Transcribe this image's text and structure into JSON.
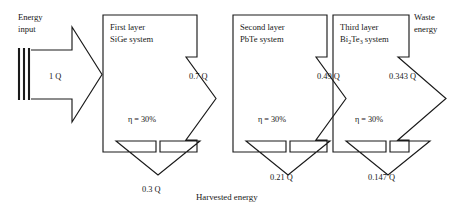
{
  "diagram": {
    "title_caption": "Harvested energy",
    "source": {
      "label_line1": "Energy",
      "label_line2": "input",
      "flow_value": "1 Q",
      "bar_count": 3
    },
    "waste": {
      "label_line1": "Waste",
      "label_line2": "energy",
      "flow_value": "0.343 Q"
    },
    "stages": [
      {
        "name_line1": "First layer",
        "name_line2_pre": "SiGe",
        "name_line2_sub": "",
        "name_line2_post": " system",
        "efficiency": "η = 30%",
        "output_right": "0.7 Q",
        "output_down": "0.3 Q"
      },
      {
        "name_line1": "Second layer",
        "name_line2_pre": "PbTe",
        "name_line2_sub": "",
        "name_line2_post": " system",
        "efficiency": "η = 30%",
        "output_right": "0.49 Q",
        "output_down": "0.21 Q"
      },
      {
        "name_line1": "Third layer",
        "name_line2_pre": "Bi",
        "name_line2_sub1": "2",
        "name_line2_mid": "Te",
        "name_line2_sub2": "3",
        "name_line2_post": " system",
        "efficiency": "η = 30%",
        "output_right": "0.343 Q",
        "output_down": "0.147 Q"
      }
    ],
    "colors": {
      "stroke": "#1a1a1a",
      "text": "#171717",
      "background": "#ffffff"
    }
  }
}
